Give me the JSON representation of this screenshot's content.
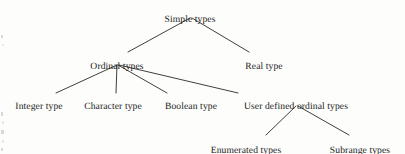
{
  "diagram": {
    "type": "tree",
    "title": "Simple types",
    "orientation": "top-down",
    "line_color": "#2a2a2a",
    "text_color": "#1b1b1b",
    "background_color": "#fdfdfb",
    "nodes": [
      {
        "id": "simple",
        "label": "Simple types",
        "x": 190,
        "y": 14,
        "level": 0
      },
      {
        "id": "ordinal",
        "label": "Ordinal types",
        "x": 117,
        "y": 61,
        "level": 1
      },
      {
        "id": "real",
        "label": "Real type",
        "x": 264,
        "y": 61,
        "level": 1
      },
      {
        "id": "integer",
        "label": "Integer type",
        "x": 39,
        "y": 101,
        "level": 2
      },
      {
        "id": "character",
        "label": "Character type",
        "x": 113,
        "y": 101,
        "level": 2
      },
      {
        "id": "boolean",
        "label": "Boolean type",
        "x": 191,
        "y": 101,
        "level": 2
      },
      {
        "id": "userdef",
        "label": "User defined ordinal types",
        "x": 296,
        "y": 101,
        "level": 2
      },
      {
        "id": "enumerated",
        "label": "Enumerated types",
        "x": 246,
        "y": 145,
        "level": 3
      },
      {
        "id": "subrange",
        "label": "Subrange types",
        "x": 360,
        "y": 145,
        "level": 3
      }
    ],
    "edges": [
      {
        "from": "simple",
        "to": "ordinal",
        "x1": 190,
        "y1": 18,
        "x2": 128,
        "y2": 52
      },
      {
        "from": "simple",
        "to": "real",
        "x1": 192,
        "y1": 18,
        "x2": 249,
        "y2": 52
      },
      {
        "from": "ordinal",
        "to": "integer",
        "x1": 117,
        "y1": 65,
        "x2": 56,
        "y2": 93
      },
      {
        "from": "ordinal",
        "to": "character",
        "x1": 117,
        "y1": 65,
        "x2": 116,
        "y2": 93
      },
      {
        "from": "ordinal",
        "to": "boolean",
        "x1": 118,
        "y1": 65,
        "x2": 167,
        "y2": 93
      },
      {
        "from": "ordinal",
        "to": "userdef",
        "x1": 119,
        "y1": 65,
        "x2": 238,
        "y2": 93
      },
      {
        "from": "userdef",
        "to": "enumerated",
        "x1": 296,
        "y1": 106,
        "x2": 266,
        "y2": 135
      },
      {
        "from": "userdef",
        "to": "subrange",
        "x1": 298,
        "y1": 106,
        "x2": 349,
        "y2": 135
      }
    ],
    "speckles": [
      {
        "x": 1,
        "y": 35,
        "w": 2,
        "h": 3,
        "soft": false
      },
      {
        "x": 2,
        "y": 44,
        "w": 2,
        "h": 2,
        "soft": true
      },
      {
        "x": 1,
        "y": 112,
        "w": 2,
        "h": 4,
        "soft": false
      },
      {
        "x": 2,
        "y": 121,
        "w": 2,
        "h": 3,
        "soft": true
      },
      {
        "x": 1,
        "y": 130,
        "w": 3,
        "h": 4,
        "soft": false
      },
      {
        "x": 2,
        "y": 140,
        "w": 2,
        "h": 3,
        "soft": true
      },
      {
        "x": 1,
        "y": 148,
        "w": 2,
        "h": 3,
        "soft": false
      }
    ]
  }
}
